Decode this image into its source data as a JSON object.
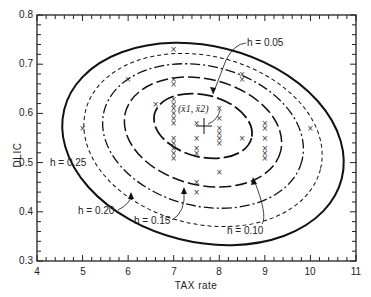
{
  "chart_data": {
    "type": "scatter",
    "title": "",
    "xlabel": "TAX rate",
    "ylabel": "DLIC",
    "xlim": [
      4,
      11
    ],
    "ylim": [
      0.3,
      0.8
    ],
    "x_ticks": [
      "4",
      "5",
      "6",
      "7",
      "8",
      "9",
      "10",
      "11"
    ],
    "y_ticks": [
      "0.3",
      "0.4",
      "0.5",
      "0.6",
      "0.7",
      "0.8"
    ],
    "grid": false,
    "centroid_label": "(x̄1, x̄2)",
    "centroid": {
      "x": 7.65,
      "y": 0.58
    },
    "contours": [
      {
        "label": "h = 0.05",
        "style": "long-dash"
      },
      {
        "label": "h = 0.10",
        "style": "long-short-dash"
      },
      {
        "label": "h = 0.15",
        "style": "dash-dot"
      },
      {
        "label": "h = 0.20",
        "style": "short-dash"
      },
      {
        "label": "h = 0.25",
        "style": "solid"
      }
    ],
    "points": [
      {
        "x": 5.0,
        "y": 0.57
      },
      {
        "x": 6.0,
        "y": 0.67
      },
      {
        "x": 6.6,
        "y": 0.62
      },
      {
        "x": 7.0,
        "y": 0.73
      },
      {
        "x": 7.0,
        "y": 0.67
      },
      {
        "x": 7.0,
        "y": 0.66
      },
      {
        "x": 7.0,
        "y": 0.63
      },
      {
        "x": 7.0,
        "y": 0.62
      },
      {
        "x": 7.0,
        "y": 0.61
      },
      {
        "x": 7.0,
        "y": 0.6
      },
      {
        "x": 7.0,
        "y": 0.59
      },
      {
        "x": 7.0,
        "y": 0.58
      },
      {
        "x": 7.0,
        "y": 0.55
      },
      {
        "x": 7.0,
        "y": 0.54
      },
      {
        "x": 7.0,
        "y": 0.53
      },
      {
        "x": 7.0,
        "y": 0.52
      },
      {
        "x": 7.0,
        "y": 0.51
      },
      {
        "x": 7.5,
        "y": 0.58
      },
      {
        "x": 7.5,
        "y": 0.55
      },
      {
        "x": 7.5,
        "y": 0.53
      },
      {
        "x": 7.5,
        "y": 0.52
      },
      {
        "x": 7.5,
        "y": 0.46
      },
      {
        "x": 7.5,
        "y": 0.44
      },
      {
        "x": 8.0,
        "y": 0.61
      },
      {
        "x": 8.0,
        "y": 0.59
      },
      {
        "x": 8.0,
        "y": 0.57
      },
      {
        "x": 8.0,
        "y": 0.56
      },
      {
        "x": 8.0,
        "y": 0.55
      },
      {
        "x": 8.0,
        "y": 0.54
      },
      {
        "x": 8.0,
        "y": 0.48
      },
      {
        "x": 8.5,
        "y": 0.68
      },
      {
        "x": 8.5,
        "y": 0.67
      },
      {
        "x": 8.5,
        "y": 0.55
      },
      {
        "x": 9.0,
        "y": 0.58
      },
      {
        "x": 9.0,
        "y": 0.57
      },
      {
        "x": 9.0,
        "y": 0.55
      },
      {
        "x": 9.0,
        "y": 0.53
      },
      {
        "x": 9.0,
        "y": 0.52
      },
      {
        "x": 9.0,
        "y": 0.51
      },
      {
        "x": 10.0,
        "y": 0.57
      }
    ]
  }
}
